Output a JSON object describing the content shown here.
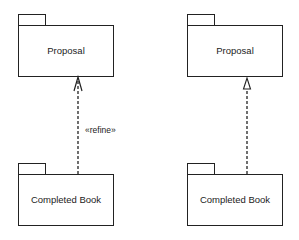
{
  "diagrams": [
    {
      "supplier": {
        "label": "Proposal"
      },
      "client": {
        "label": "Completed Book"
      },
      "relationship": {
        "kind": "refine-dependency",
        "stereotype": "«refine»",
        "arrowhead": "open"
      }
    },
    {
      "supplier": {
        "label": "Proposal"
      },
      "client": {
        "label": "Completed Book"
      },
      "relationship": {
        "kind": "realization",
        "arrowhead": "hollow-triangle"
      }
    }
  ]
}
